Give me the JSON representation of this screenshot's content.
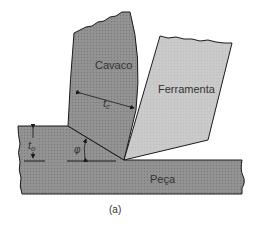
{
  "diagram": {
    "caption": "(a)",
    "labels": {
      "chip": "Cavaco",
      "tool": "Ferramenta",
      "workpiece": "Peça",
      "chip_thickness": "t",
      "chip_thickness_sub": "c",
      "uncut_thickness": "t",
      "uncut_thickness_sub": "o",
      "shear_angle": "φ"
    },
    "colors": {
      "chip_fill": "#8e8e8e",
      "workpiece_fill": "#8e8e8e",
      "tool_fill": "#c9c9c9",
      "outline": "#1a1a1a",
      "background": "#ffffff"
    }
  }
}
